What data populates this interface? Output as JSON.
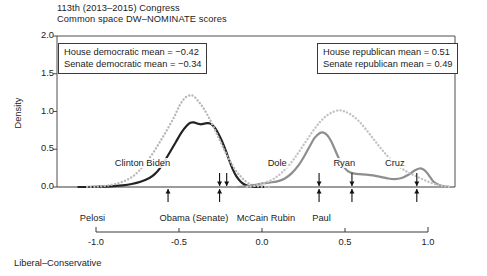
{
  "chart_data": {
    "type": "line",
    "title": "113th (2013–2015) Congress",
    "subtitle": "Common space DW–NOMINATE scores",
    "xlabel": "Liberal–Conservative",
    "ylabel": "Density",
    "xlim": [
      -1.12,
      1.12
    ],
    "ylim": [
      0.0,
      2.0
    ],
    "xticks": [
      "-1.0",
      "-0.5",
      "0.0",
      "0.5",
      "1.0"
    ],
    "xtick_values": [
      -1.0,
      -0.5,
      0.0,
      0.5,
      1.0
    ],
    "yticks": [
      "0.0",
      "0.5",
      "1.0",
      "1.5",
      "2.0"
    ],
    "ytick_values": [
      0.0,
      0.5,
      1.0,
      1.5,
      2.0
    ],
    "grid": false,
    "legend_position": "none",
    "series": [
      {
        "name": "House democrats",
        "style": "solid",
        "color": "#232323",
        "width": 2.2,
        "points": [
          [
            -1.0,
            0.0
          ],
          [
            -0.95,
            0.0
          ],
          [
            -0.9,
            0.003
          ],
          [
            -0.85,
            0.006
          ],
          [
            -0.8,
            0.012
          ],
          [
            -0.75,
            0.022
          ],
          [
            -0.7,
            0.04
          ],
          [
            -0.65,
            0.07
          ],
          [
            -0.6,
            0.12
          ],
          [
            -0.57,
            0.17
          ],
          [
            -0.54,
            0.25
          ],
          [
            -0.51,
            0.36
          ],
          [
            -0.48,
            0.48
          ],
          [
            -0.45,
            0.6
          ],
          [
            -0.42,
            0.72
          ],
          [
            -0.39,
            0.81
          ],
          [
            -0.37,
            0.85
          ],
          [
            -0.35,
            0.855
          ],
          [
            -0.33,
            0.84
          ],
          [
            -0.31,
            0.83
          ],
          [
            -0.29,
            0.84
          ],
          [
            -0.27,
            0.845
          ],
          [
            -0.25,
            0.83
          ],
          [
            -0.23,
            0.78
          ],
          [
            -0.21,
            0.7
          ],
          [
            -0.19,
            0.6
          ],
          [
            -0.17,
            0.48
          ],
          [
            -0.15,
            0.35
          ],
          [
            -0.13,
            0.23
          ],
          [
            -0.11,
            0.14
          ],
          [
            -0.09,
            0.08
          ],
          [
            -0.07,
            0.04
          ],
          [
            -0.05,
            0.018
          ],
          [
            -0.03,
            0.008
          ],
          [
            0.0,
            0.002
          ],
          [
            0.05,
            0.0
          ]
        ]
      },
      {
        "name": "Senate democrats",
        "style": "dotted",
        "color": "#b9b9b9",
        "width": 2.4,
        "points": [
          [
            -0.95,
            0.0
          ],
          [
            -0.9,
            0.005
          ],
          [
            -0.85,
            0.015
          ],
          [
            -0.8,
            0.035
          ],
          [
            -0.75,
            0.07
          ],
          [
            -0.7,
            0.13
          ],
          [
            -0.66,
            0.21
          ],
          [
            -0.62,
            0.32
          ],
          [
            -0.58,
            0.45
          ],
          [
            -0.54,
            0.6
          ],
          [
            -0.5,
            0.76
          ],
          [
            -0.46,
            0.93
          ],
          [
            -0.43,
            1.08
          ],
          [
            -0.4,
            1.18
          ],
          [
            -0.37,
            1.215
          ],
          [
            -0.35,
            1.2
          ],
          [
            -0.33,
            1.15
          ],
          [
            -0.3,
            1.06
          ],
          [
            -0.27,
            0.94
          ],
          [
            -0.24,
            0.8
          ],
          [
            -0.21,
            0.65
          ],
          [
            -0.18,
            0.5
          ],
          [
            -0.15,
            0.36
          ],
          [
            -0.12,
            0.24
          ],
          [
            -0.09,
            0.15
          ],
          [
            -0.06,
            0.08
          ],
          [
            -0.03,
            0.035
          ],
          [
            0.0,
            0.012
          ],
          [
            0.04,
            0.003
          ],
          [
            0.08,
            0.0
          ]
        ]
      },
      {
        "name": "House republicans",
        "style": "solid",
        "color": "#8e8e8e",
        "width": 2.2,
        "points": [
          [
            -0.1,
            0.0
          ],
          [
            -0.05,
            0.01
          ],
          [
            0.0,
            0.03
          ],
          [
            0.04,
            0.05
          ],
          [
            0.08,
            0.06
          ],
          [
            0.12,
            0.075
          ],
          [
            0.16,
            0.11
          ],
          [
            0.2,
            0.18
          ],
          [
            0.24,
            0.29
          ],
          [
            0.27,
            0.4
          ],
          [
            0.3,
            0.53
          ],
          [
            0.33,
            0.65
          ],
          [
            0.36,
            0.715
          ],
          [
            0.38,
            0.72
          ],
          [
            0.4,
            0.69
          ],
          [
            0.42,
            0.62
          ],
          [
            0.44,
            0.52
          ],
          [
            0.46,
            0.41
          ],
          [
            0.48,
            0.32
          ],
          [
            0.5,
            0.25
          ],
          [
            0.52,
            0.205
          ],
          [
            0.55,
            0.18
          ],
          [
            0.58,
            0.17
          ],
          [
            0.62,
            0.165
          ],
          [
            0.66,
            0.155
          ],
          [
            0.7,
            0.135
          ],
          [
            0.74,
            0.115
          ],
          [
            0.78,
            0.105
          ],
          [
            0.82,
            0.12
          ],
          [
            0.86,
            0.165
          ],
          [
            0.89,
            0.215
          ],
          [
            0.92,
            0.245
          ],
          [
            0.94,
            0.235
          ],
          [
            0.96,
            0.195
          ],
          [
            0.98,
            0.13
          ],
          [
            1.0,
            0.07
          ],
          [
            1.03,
            0.028
          ],
          [
            1.06,
            0.008
          ],
          [
            1.09,
            0.0
          ]
        ]
      },
      {
        "name": "Senate republicans",
        "style": "dotted",
        "color": "#c3c3c3",
        "width": 2.4,
        "points": [
          [
            -0.05,
            0.0
          ],
          [
            0.0,
            0.02
          ],
          [
            0.05,
            0.055
          ],
          [
            0.1,
            0.11
          ],
          [
            0.15,
            0.2
          ],
          [
            0.2,
            0.33
          ],
          [
            0.24,
            0.46
          ],
          [
            0.28,
            0.6
          ],
          [
            0.32,
            0.74
          ],
          [
            0.36,
            0.86
          ],
          [
            0.4,
            0.95
          ],
          [
            0.44,
            1.0
          ],
          [
            0.47,
            1.015
          ],
          [
            0.5,
            1.0
          ],
          [
            0.54,
            0.95
          ],
          [
            0.58,
            0.87
          ],
          [
            0.62,
            0.76
          ],
          [
            0.66,
            0.64
          ],
          [
            0.7,
            0.52
          ],
          [
            0.74,
            0.41
          ],
          [
            0.78,
            0.32
          ],
          [
            0.82,
            0.245
          ],
          [
            0.86,
            0.19
          ],
          [
            0.9,
            0.145
          ],
          [
            0.94,
            0.1
          ],
          [
            0.98,
            0.06
          ],
          [
            1.02,
            0.03
          ],
          [
            1.06,
            0.01
          ],
          [
            1.1,
            0.0
          ]
        ]
      }
    ],
    "annotation_boxes": [
      {
        "id": "democratic-means",
        "lines": [
          "House democratic mean = −0.42",
          "Senate democratic mean = −0.34"
        ]
      },
      {
        "id": "republican-means",
        "lines": [
          "House republican mean = 0.51",
          "Senate republican mean = 0.49"
        ]
      }
    ],
    "inplot_labels": [
      {
        "text": "Clinton Biden",
        "x": -0.8,
        "y": 0.3
      },
      {
        "text": "Dole",
        "x": 0.06,
        "y": 0.3
      },
      {
        "text": "Ryan",
        "x": 0.43,
        "y": 0.3
      },
      {
        "text": "Cruz",
        "x": 0.72,
        "y": 0.3
      }
    ],
    "markers_above": [
      {
        "name": "Obama",
        "x": -0.205,
        "direction": "down"
      },
      {
        "name": "Biden",
        "x": -0.165,
        "direction": "down"
      },
      {
        "name": "McCain",
        "x": 0.355,
        "direction": "down"
      },
      {
        "name": "Rubin",
        "x": 0.54,
        "direction": "down"
      },
      {
        "name": "Paul",
        "x": 0.905,
        "direction": "down"
      }
    ],
    "markers_below": [
      {
        "name": "Pelosi",
        "x": -0.495,
        "direction": "up"
      },
      {
        "name": "Obama",
        "x": -0.205,
        "direction": "up"
      },
      {
        "name": "McCain",
        "x": 0.355,
        "direction": "up"
      },
      {
        "name": "Rubin",
        "x": 0.54,
        "direction": "up"
      },
      {
        "name": "Paul",
        "x": 0.905,
        "direction": "up"
      }
    ],
    "axis_name_labels": [
      {
        "text": "Pelosi",
        "x": -0.495
      },
      {
        "text": "Obama (Senate)",
        "x": -0.015
      },
      {
        "text": "McCain Rubin",
        "x": 0.45
      },
      {
        "text": "Paul",
        "x": 0.905
      }
    ]
  },
  "axis": {
    "y_title": "Density",
    "x_title": "Liberal–Conservative"
  }
}
